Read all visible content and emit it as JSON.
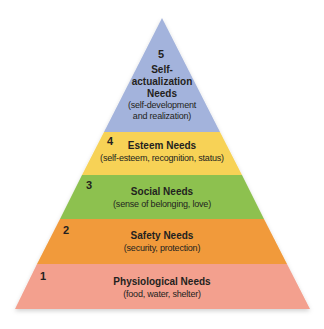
{
  "diagram": {
    "type": "pyramid",
    "colors": {
      "level5": "#a3b3dc",
      "level4": "#f7d257",
      "level3": "#8dc14f",
      "level2": "#f19a3b",
      "level1": "#f3a08e"
    },
    "levels": [
      {
        "number": "5",
        "title_lines": [
          "Self-",
          "actualization",
          "Needs"
        ],
        "subtitle_lines": [
          "(self-development",
          "and realization)"
        ]
      },
      {
        "number": "4",
        "title": "Esteem Needs",
        "subtitle": "(self-esteem, recognition, status)"
      },
      {
        "number": "3",
        "title": "Social Needs",
        "subtitle": "(sense of belonging, love)"
      },
      {
        "number": "2",
        "title": "Safety Needs",
        "subtitle": "(security, protection)"
      },
      {
        "number": "1",
        "title": "Physiological Needs",
        "subtitle": "(food, water, shelter)"
      }
    ]
  }
}
